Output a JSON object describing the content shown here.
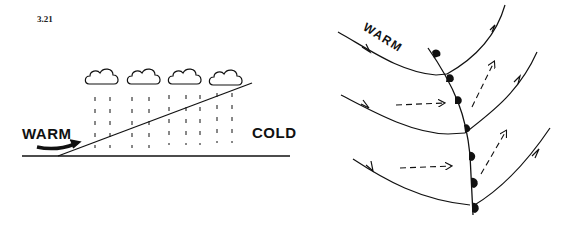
{
  "figure": {
    "number": "3.21"
  },
  "left_panel": {
    "title": "Warm front cross-section",
    "warm_label": "WARM",
    "cold_label": "COLD",
    "cloud_count": 4,
    "icons": [
      "cloud-icon",
      "rain-streaks",
      "warm-air-arrow-icon",
      "frontal-surface-line",
      "ground-line"
    ]
  },
  "right_panel": {
    "title": "Warm front plan view",
    "warm_label": "WARM",
    "front_symbol": "warm-front-semicircles",
    "streamline_count": 3,
    "dashed_arrow_count": 4,
    "icons": [
      "streamline-arrow-icon",
      "dashed-arrow-icon",
      "front-semicircle-icon"
    ]
  },
  "colors": {
    "ink": "#111111",
    "background": "#ffffff"
  }
}
